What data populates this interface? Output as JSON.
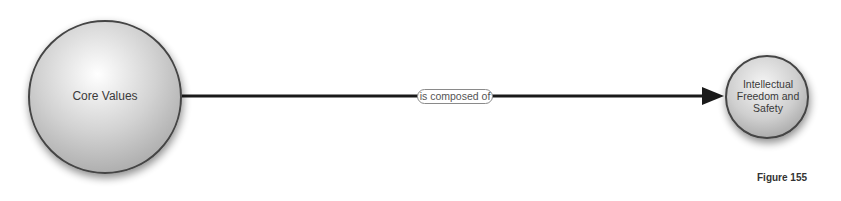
{
  "diagram": {
    "nodes": [
      {
        "id": "core",
        "label": "Core Values"
      },
      {
        "id": "target",
        "label": "Intellectual\nFreedom and\nSafety"
      }
    ],
    "edges": [
      {
        "from": "core",
        "to": "target",
        "label": "is composed of"
      }
    ],
    "caption": "Figure 155"
  }
}
